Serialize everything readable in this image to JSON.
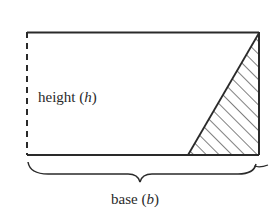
{
  "diagram": {
    "type": "rectangle-with-triangle-cut",
    "labels": {
      "height": "height",
      "height_var": "h",
      "base": "base",
      "base_var": "b"
    },
    "colors": {
      "stroke": "#2a2a2a",
      "background": "#ffffff"
    }
  }
}
